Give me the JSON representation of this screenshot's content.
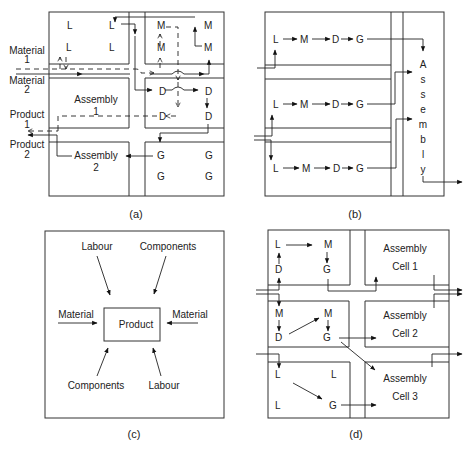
{
  "figure": {
    "panels": [
      {
        "id": "a",
        "caption": "(a)",
        "external_labels": {
          "material1": [
            "Material",
            "1"
          ],
          "material2": [
            "Material",
            "2"
          ],
          "product1": [
            "Product",
            "1"
          ],
          "product2": [
            "Product",
            "2"
          ]
        },
        "cells": {
          "top_left": [
            "L",
            "L",
            "L",
            "L"
          ],
          "top_right": [
            "M",
            "M",
            "M",
            "M"
          ],
          "middle_right": [
            "D",
            "D",
            "D",
            "D"
          ],
          "bottom_right": [
            "G",
            "G",
            "G",
            "G"
          ]
        },
        "assembly1": [
          "Assembly",
          "1"
        ],
        "assembly2": [
          "Assembly",
          "2"
        ]
      },
      {
        "id": "b",
        "caption": "(b)",
        "rows": [
          [
            "L",
            "M",
            "D",
            "G"
          ],
          [
            "L",
            "M",
            "D",
            "G"
          ],
          [
            "L",
            "M",
            "D",
            "G"
          ]
        ],
        "assembly_letters": [
          "A",
          "s",
          "s",
          "e",
          "m",
          "b",
          "l",
          "y"
        ]
      },
      {
        "id": "c",
        "caption": "(c)",
        "center": "Product",
        "inputs": {
          "top_left": "Labour",
          "top_right": "Components",
          "left": "Material",
          "right": "Material",
          "bottom_left": "Components",
          "bottom_right": "Labour"
        }
      },
      {
        "id": "d",
        "caption": "(d)",
        "cell1": {
          "L": "L",
          "M": "M",
          "D": "D",
          "G": "G"
        },
        "cell2": {
          "M1": "M",
          "M2": "M",
          "D": "D",
          "G": "G"
        },
        "cell3": {
          "L1": "L",
          "L2": "L",
          "L3": "L",
          "G": "G"
        },
        "assembly_cells": [
          [
            "Assembly",
            "Cell 1"
          ],
          [
            "Assembly",
            "Cell 2"
          ],
          [
            "Assembly",
            "Cell 3"
          ]
        ]
      }
    ]
  }
}
